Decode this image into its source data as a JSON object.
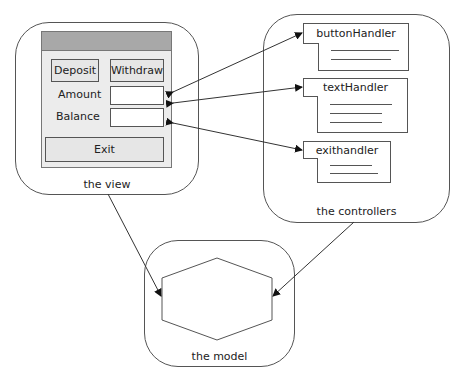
{
  "view": {
    "label": "the view",
    "window": {
      "buttons": {
        "deposit": "Deposit",
        "withdraw": "Withdraw",
        "exit": "Exit"
      },
      "fields": {
        "amount_label": "Amount",
        "amount_value": "",
        "balance_label": "Balance",
        "balance_value": ""
      }
    }
  },
  "controllers": {
    "label": "the controllers",
    "handlers": [
      {
        "name": "buttonHandler",
        "lines": 2
      },
      {
        "name": "textHandler",
        "lines": 3
      },
      {
        "name": "exithandler",
        "lines": 2
      }
    ]
  },
  "model": {
    "label": "the model",
    "object": "anAccount"
  },
  "connections": [
    {
      "from": "view.amount_field",
      "to": "controllers.buttonHandler",
      "type": "bidirectional"
    },
    {
      "from": "view.amount_field",
      "to": "controllers.textHandler",
      "type": "bidirectional"
    },
    {
      "from": "view.balance_field",
      "to": "controllers.exithandler",
      "type": "bidirectional"
    },
    {
      "from": "the view",
      "to": "anAccount",
      "type": "directed"
    },
    {
      "from": "the controllers",
      "to": "anAccount",
      "type": "directed"
    }
  ]
}
